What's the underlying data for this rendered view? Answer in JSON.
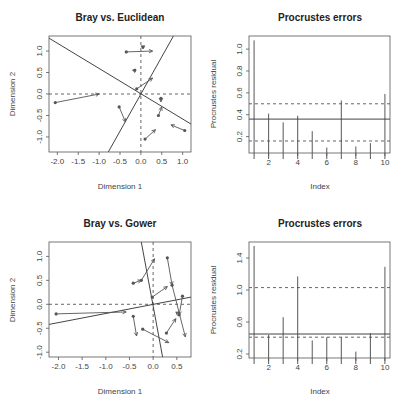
{
  "chart_data": [
    {
      "type": "scatter",
      "title": "Bray vs. Euclidean",
      "xlabel": "Dimension 1",
      "ylabel": "Dimension 2",
      "xlim": [
        -2.2,
        1.2
      ],
      "ylim": [
        -1.35,
        1.35
      ],
      "xticks": [
        "-2.0",
        "-1.5",
        "-1.0",
        "-0.5",
        "0.0",
        "0.5",
        "1.0"
      ],
      "yticks": [
        "-1.0",
        "-0.5",
        "0.0",
        "0.5",
        "1.0"
      ],
      "rotation_lines": [
        {
          "x1": -2.2,
          "y1": 1.3,
          "x2": 1.2,
          "y2": -0.7
        },
        {
          "x1": -0.78,
          "y1": -1.35,
          "x2": 0.78,
          "y2": 1.35
        }
      ],
      "arrows": [
        {
          "from": [
            -2.05,
            -0.2
          ],
          "to": [
            -1.0,
            0.0
          ]
        },
        {
          "from": [
            -0.35,
            0.98
          ],
          "to": [
            0.28,
            1.0
          ]
        },
        {
          "from": [
            0.05,
            1.1
          ],
          "to": [
            0.05,
            1.05
          ]
        },
        {
          "from": [
            -0.15,
            0.55
          ],
          "to": [
            -0.12,
            0.58
          ]
        },
        {
          "from": [
            -0.1,
            0.12
          ],
          "to": [
            0.28,
            0.37
          ]
        },
        {
          "from": [
            -0.52,
            -0.3
          ],
          "to": [
            -0.37,
            -0.65
          ]
        },
        {
          "from": [
            0.48,
            -0.1
          ],
          "to": [
            0.48,
            -0.18
          ]
        },
        {
          "from": [
            0.42,
            -0.5
          ],
          "to": [
            0.5,
            -0.3
          ]
        },
        {
          "from": [
            0.1,
            -1.05
          ],
          "to": [
            0.35,
            -0.83
          ]
        },
        {
          "from": [
            1.05,
            -0.85
          ],
          "to": [
            0.72,
            -0.72
          ]
        }
      ]
    },
    {
      "type": "bar",
      "subtype": "spike",
      "title": "Procrustes errors",
      "xlabel": "Index",
      "ylabel": "Procrustes residual",
      "categories": [
        1,
        2,
        3,
        4,
        5,
        6,
        7,
        8,
        9,
        10
      ],
      "values": [
        1.08,
        0.41,
        0.33,
        0.39,
        0.25,
        0.1,
        0.53,
        0.11,
        0.14,
        0.59
      ],
      "xticks": [
        "2",
        "4",
        "6",
        "8",
        "10"
      ],
      "yticks": [
        "0.2",
        "0.4",
        "0.6",
        "0.8",
        "1.0"
      ],
      "ylim": [
        0.05,
        1.12
      ],
      "hlines": {
        "median": 0.36,
        "quartile_low": 0.16,
        "quartile_high": 0.5
      }
    },
    {
      "type": "scatter",
      "title": "Bray vs. Gower",
      "xlabel": "Dimension 1",
      "ylabel": "Dimension 2",
      "xlim": [
        -2.2,
        0.8
      ],
      "ylim": [
        -1.1,
        1.3
      ],
      "xticks": [
        "-2.0",
        "-1.5",
        "-1.0",
        "-0.5",
        "0.0",
        "0.5"
      ],
      "yticks": [
        "-1.0",
        "-0.5",
        "0.0",
        "0.5",
        "1.0"
      ],
      "rotation_lines": [
        {
          "x1": -2.2,
          "y1": -0.42,
          "x2": 0.8,
          "y2": 0.15
        },
        {
          "x1": -0.25,
          "y1": 1.3,
          "x2": 0.2,
          "y2": -1.1
        }
      ],
      "arrows": [
        {
          "from": [
            -2.05,
            -0.2
          ],
          "to": [
            -0.57,
            -0.16
          ]
        },
        {
          "from": [
            -0.42,
            0.44
          ],
          "to": [
            -0.25,
            0.5
          ]
        },
        {
          "from": [
            -0.25,
            0.5
          ],
          "to": [
            0.03,
            0.95
          ]
        },
        {
          "from": [
            -0.02,
            0.15
          ],
          "to": [
            0.3,
            0.37
          ]
        },
        {
          "from": [
            -0.42,
            -0.25
          ],
          "to": [
            -0.35,
            -0.66
          ]
        },
        {
          "from": [
            -0.22,
            -0.52
          ],
          "to": [
            0.33,
            -0.8
          ]
        },
        {
          "from": [
            0.3,
            0.97
          ],
          "to": [
            0.4,
            0.4
          ]
        },
        {
          "from": [
            0.4,
            0.4
          ],
          "to": [
            0.68,
            -0.68
          ]
        },
        {
          "from": [
            0.28,
            -0.6
          ],
          "to": [
            0.48,
            -0.3
          ]
        },
        {
          "from": [
            0.62,
            0.17
          ],
          "to": [
            0.55,
            -0.22
          ]
        },
        {
          "from": [
            0.55,
            -0.22
          ],
          "to": [
            0.48,
            -0.16
          ]
        }
      ]
    },
    {
      "type": "bar",
      "subtype": "spike",
      "title": "Procrustes errors",
      "xlabel": "Index",
      "ylabel": "Procrustes residual",
      "categories": [
        1,
        2,
        3,
        4,
        5,
        6,
        7,
        8,
        9,
        10
      ],
      "values": [
        1.55,
        0.44,
        0.66,
        1.17,
        0.37,
        0.41,
        0.41,
        0.23,
        0.46,
        1.29
      ],
      "xticks": [
        "2",
        "4",
        "6",
        "8",
        "10"
      ],
      "yticks": [
        "0.2",
        "0.6",
        "1.0",
        "1.4"
      ],
      "ylim": [
        0.15,
        1.6
      ],
      "hlines": {
        "median": 0.45,
        "quartile_low": 0.41,
        "quartile_high": 1.03
      }
    }
  ]
}
